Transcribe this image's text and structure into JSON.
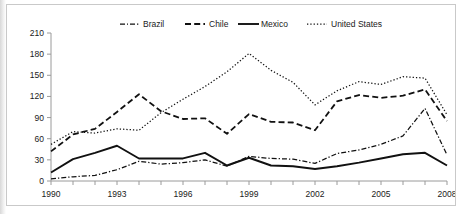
{
  "chart_data": {
    "type": "line",
    "title": "",
    "subtitle": "",
    "xlabel": "",
    "ylabel": "",
    "xlim": [
      1990,
      2008
    ],
    "ylim": [
      0,
      210
    ],
    "yticks": [
      0,
      30,
      60,
      90,
      120,
      150,
      180,
      210
    ],
    "xticks_labeled": [
      1990,
      1993,
      1996,
      1999,
      2002,
      2005,
      2008
    ],
    "x": [
      1990,
      1991,
      1992,
      1993,
      1994,
      1995,
      1996,
      1997,
      1998,
      1999,
      2000,
      2001,
      2002,
      2003,
      2004,
      2005,
      2006,
      2007,
      2008
    ],
    "grid": false,
    "legend_position": "top",
    "series": [
      {
        "name": "Brazil",
        "style": "dash-dot",
        "color": "#111111",
        "values": [
          3,
          6,
          8,
          16,
          28,
          24,
          26,
          30,
          21,
          35,
          32,
          31,
          25,
          39,
          44,
          52,
          64,
          103,
          37
        ]
      },
      {
        "name": "Chile",
        "style": "dashed",
        "color": "#111111",
        "values": [
          42,
          66,
          74,
          98,
          123,
          99,
          88,
          89,
          67,
          95,
          84,
          83,
          72,
          113,
          122,
          118,
          121,
          130,
          85
        ]
      },
      {
        "name": "Mexico",
        "style": "solid",
        "color": "#111111",
        "values": [
          12,
          31,
          40,
          50,
          32,
          32,
          32,
          40,
          22,
          33,
          22,
          21,
          17,
          21,
          26,
          32,
          38,
          40,
          22
        ]
      },
      {
        "name": "United States",
        "style": "dotted",
        "color": "#111111",
        "values": [
          52,
          70,
          68,
          74,
          72,
          97,
          116,
          134,
          155,
          181,
          157,
          140,
          108,
          128,
          141,
          137,
          148,
          146,
          94
        ]
      }
    ]
  },
  "legend": {
    "items": [
      {
        "label": "Brazil"
      },
      {
        "label": "Chile"
      },
      {
        "label": "Mexico"
      },
      {
        "label": "United States"
      }
    ]
  },
  "axes": {
    "y_tick_labels": [
      "210",
      "180",
      "150",
      "120",
      "90",
      "60",
      "30",
      "0"
    ],
    "x_tick_labels": [
      "1990",
      "1993",
      "1996",
      "1999",
      "2002",
      "2005",
      "2008"
    ]
  }
}
